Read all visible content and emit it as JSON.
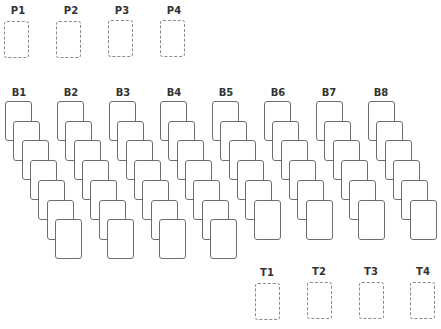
{
  "free_cells": [
    {
      "label": "P1"
    },
    {
      "label": "P2"
    },
    {
      "label": "P3"
    },
    {
      "label": "P4"
    }
  ],
  "tableau": [
    {
      "label": "B1",
      "card_count": 7
    },
    {
      "label": "B2",
      "card_count": 7
    },
    {
      "label": "B3",
      "card_count": 7
    },
    {
      "label": "B4",
      "card_count": 7
    },
    {
      "label": "B5",
      "card_count": 6
    },
    {
      "label": "B6",
      "card_count": 6
    },
    {
      "label": "B7",
      "card_count": 6
    },
    {
      "label": "B8",
      "card_count": 6
    }
  ],
  "foundations": [
    {
      "label": "T1"
    },
    {
      "label": "T2"
    },
    {
      "label": "T3"
    },
    {
      "label": "T4"
    }
  ],
  "colors": {
    "background": "#ffffff",
    "card_border": "#6e6e6e",
    "slot_border": "#8a8a8a",
    "label": "#333333"
  }
}
